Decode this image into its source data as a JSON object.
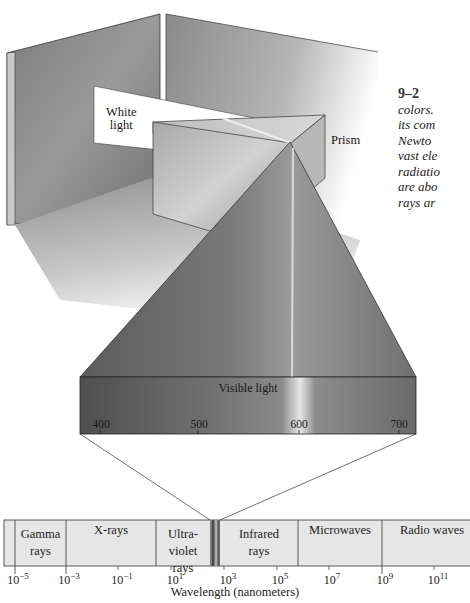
{
  "figure": {
    "number": "9–2",
    "caption_lines": [
      "colors.",
      "its com",
      "Newto",
      "vast ele",
      "radiatio",
      "are abo",
      "rays ar"
    ]
  },
  "labels": {
    "white_light": [
      "White",
      "light"
    ],
    "prism": "Prism",
    "visible_light": "Visible light"
  },
  "visible_scale": {
    "ticks": [
      "400",
      "500",
      "600",
      "700"
    ],
    "unit": "nm"
  },
  "spectrum": {
    "regions": [
      {
        "name": "Gamma rays",
        "lines": [
          "Gamma",
          "rays"
        ]
      },
      {
        "name": "X-rays",
        "lines": [
          "X-rays"
        ]
      },
      {
        "name": "Ultraviolet rays",
        "lines": [
          "Ultra-",
          "violet",
          "rays"
        ]
      },
      {
        "name": "Visible",
        "lines": []
      },
      {
        "name": "Infrared rays",
        "lines": [
          "Infrared",
          "rays"
        ]
      },
      {
        "name": "Microwaves",
        "lines": [
          "Microwaves"
        ]
      },
      {
        "name": "Radio waves",
        "lines": [
          "Radio waves"
        ]
      }
    ],
    "ticks": [
      {
        "base": "10",
        "exp": "−5"
      },
      {
        "base": "10",
        "exp": "−3"
      },
      {
        "base": "10",
        "exp": "−1"
      },
      {
        "base": "10",
        "exp": "1"
      },
      {
        "base": "10",
        "exp": "3"
      },
      {
        "base": "10",
        "exp": "5"
      },
      {
        "base": "10",
        "exp": "7"
      },
      {
        "base": "10",
        "exp": "9"
      },
      {
        "base": "10",
        "exp": "11"
      }
    ],
    "axis_label": "Wavelength (nanometers)"
  },
  "colors": {
    "wall": "#8a8a8a",
    "band": "#6e6e6e",
    "bar_fill": "#e6e6e6",
    "line": "#333333"
  }
}
